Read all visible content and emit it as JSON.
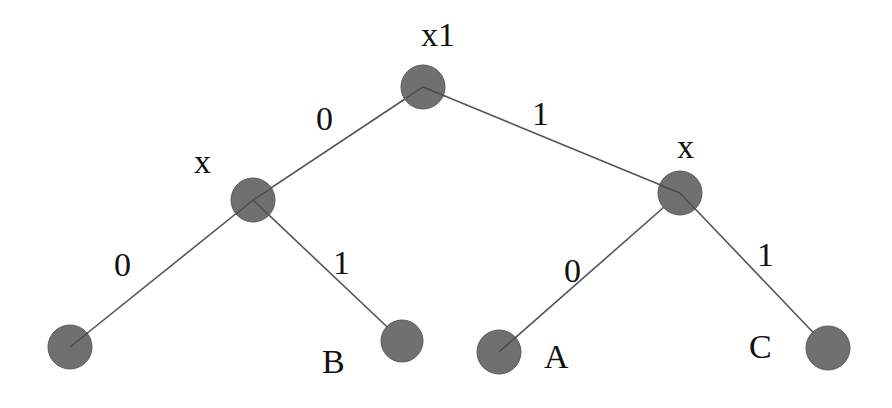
{
  "diagram": {
    "type": "binary decision tree",
    "node_color": "#707070",
    "edge_color": "#555555",
    "nodes": [
      {
        "id": "root",
        "label": "x1",
        "cx": 423,
        "cy": 87
      },
      {
        "id": "left",
        "label": "x",
        "cx": 253,
        "cy": 200
      },
      {
        "id": "right",
        "label": "x",
        "cx": 680,
        "cy": 193
      },
      {
        "id": "leaf_ll",
        "label": "",
        "cx": 70,
        "cy": 347
      },
      {
        "id": "leaf_lr",
        "label": "B",
        "cx": 402,
        "cy": 341
      },
      {
        "id": "leaf_rl",
        "label": "A",
        "cx": 499,
        "cy": 352
      },
      {
        "id": "leaf_rr",
        "label": "C",
        "cx": 828,
        "cy": 348
      }
    ],
    "edges": [
      {
        "from": "root",
        "to": "left",
        "label": "0"
      },
      {
        "from": "root",
        "to": "right",
        "label": "1"
      },
      {
        "from": "left",
        "to": "leaf_ll",
        "label": "0"
      },
      {
        "from": "left",
        "to": "leaf_lr",
        "label": "1"
      },
      {
        "from": "right",
        "to": "leaf_rl",
        "label": "0"
      },
      {
        "from": "right",
        "to": "leaf_rr",
        "label": "1"
      }
    ]
  },
  "labels": {
    "root": "x1",
    "left": "x",
    "right": "x",
    "leaf_lr": "B",
    "leaf_rl": "A",
    "leaf_rr": "C",
    "edge_root_left": "0",
    "edge_root_right": "1",
    "edge_left_ll": "0",
    "edge_left_lr": "1",
    "edge_right_rl": "0",
    "edge_right_rr": "1"
  }
}
